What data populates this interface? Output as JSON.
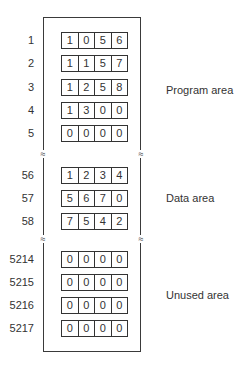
{
  "diagram": {
    "type": "memory-layout",
    "break_symbol": "≈",
    "areas": [
      {
        "label": "Program area",
        "rows": [
          {
            "address": "1",
            "digits": [
              "1",
              "0",
              "5",
              "6"
            ]
          },
          {
            "address": "2",
            "digits": [
              "1",
              "1",
              "5",
              "7"
            ]
          },
          {
            "address": "3",
            "digits": [
              "1",
              "2",
              "5",
              "8"
            ]
          },
          {
            "address": "4",
            "digits": [
              "1",
              "3",
              "0",
              "0"
            ]
          },
          {
            "address": "5",
            "digits": [
              "0",
              "0",
              "0",
              "0"
            ]
          }
        ]
      },
      {
        "label": "Data area",
        "rows": [
          {
            "address": "56",
            "digits": [
              "1",
              "2",
              "3",
              "4"
            ]
          },
          {
            "address": "57",
            "digits": [
              "5",
              "6",
              "7",
              "0"
            ]
          },
          {
            "address": "58",
            "digits": [
              "7",
              "5",
              "4",
              "2"
            ]
          }
        ]
      },
      {
        "label": "Unused area",
        "rows": [
          {
            "address": "5214",
            "digits": [
              "0",
              "0",
              "0",
              "0"
            ]
          },
          {
            "address": "5215",
            "digits": [
              "0",
              "0",
              "0",
              "0"
            ]
          },
          {
            "address": "5216",
            "digits": [
              "0",
              "0",
              "0",
              "0"
            ]
          },
          {
            "address": "5217",
            "digits": [
              "0",
              "0",
              "0",
              "0"
            ]
          }
        ]
      }
    ]
  }
}
